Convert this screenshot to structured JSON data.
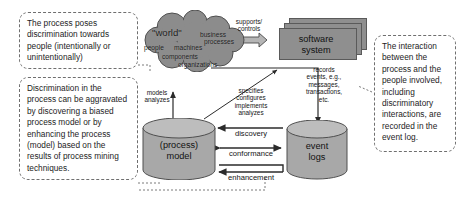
{
  "diagram": {
    "colors": {
      "cloud_fill": "#8c8c8c",
      "cloud_stroke": "#4f4f4f",
      "box_fill": "#8f8f8f",
      "box_stroke": "#5a5a5a",
      "cylinder_fill": "#a8a8a8",
      "cylinder_top": "#bdbdbd",
      "cylinder_stroke": "#4f4f4f",
      "arrow_fill": "#b5b5b5",
      "arrow_stroke": "#4a4a4a",
      "line": "#2b2b2b",
      "callout_border": "#6f6f6f",
      "text": "#1d1d1d",
      "background": "#ffffff"
    },
    "callouts": [
      {
        "id": "top-left",
        "text": "The process poses discrimination towards people (intentionally or unintentionally)"
      },
      {
        "id": "bottom-left",
        "text": "Discrimination in the process can be aggravated by discovering a biased process model or by enhancing the process (model) based on the results of process mining techniques."
      },
      {
        "id": "right",
        "text": "The interaction between the process and the people involved, including discriminatory interactions, are recorded in the event log."
      }
    ],
    "cloud": {
      "name": "world",
      "main_label": "\"world\"",
      "terms": [
        "business",
        "processes",
        "people",
        "machines",
        "components",
        "organizations"
      ]
    },
    "software_system": {
      "label": "software\nsystem",
      "line1": "software",
      "line2": "system"
    },
    "process_model": {
      "line1": "(process)",
      "line2": "model"
    },
    "event_logs": {
      "line1": "event",
      "line2": "logs"
    },
    "edges": [
      {
        "id": "supports-controls",
        "label": "supports/\ncontrols",
        "from": "world",
        "to": "software system",
        "style": "double-block-arrow"
      },
      {
        "id": "records-events",
        "label": "records\nevents, e.g.,\nmessages,\ntransactions,\netc.",
        "from": "software system",
        "to": "event logs",
        "style": "elbow-arrow"
      },
      {
        "id": "specifies",
        "label": "specifies\nconfigures\nimplements\nanalyzes",
        "from": "process model",
        "to": "software system",
        "style": "diagonal-arrow"
      },
      {
        "id": "models-analyzes",
        "label": "models\nanalyzes",
        "from": "process model",
        "to": "world",
        "style": "up-arrow"
      },
      {
        "id": "discovery",
        "label": "discovery",
        "from": "event logs",
        "to": "process model",
        "style": "left-arrow"
      },
      {
        "id": "conformance",
        "label": "conformance",
        "from": "process model",
        "to": "event logs",
        "style": "double-arrow"
      },
      {
        "id": "enhancement",
        "label": "enhancement",
        "from": "event logs",
        "to": "process model",
        "style": "stepped-left-arrow"
      }
    ]
  }
}
